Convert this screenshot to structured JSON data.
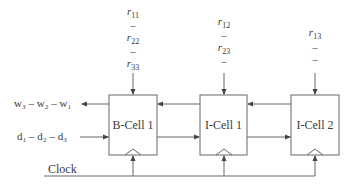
{
  "diagram": {
    "cells": [
      {
        "id": "bcell1",
        "label": "B-Cell 1"
      },
      {
        "id": "icell1",
        "label": "I-Cell 1"
      },
      {
        "id": "icell2",
        "label": "I-Cell 2"
      }
    ],
    "inputs": {
      "col1": [
        {
          "base": "r",
          "sub": "11"
        },
        {
          "dash": "–"
        },
        {
          "base": "r",
          "sub": "22"
        },
        {
          "dash": "–"
        },
        {
          "base": "r",
          "sub": "33"
        }
      ],
      "col2": [
        {
          "base": "r",
          "sub": "12"
        },
        {
          "dash": "–"
        },
        {
          "base": "r",
          "sub": "23"
        },
        {
          "dash": "–"
        }
      ],
      "col3": [
        {
          "base": "r",
          "sub": "13"
        },
        {
          "dash": "–"
        },
        {
          "dash": "–"
        }
      ]
    },
    "left_signals": {
      "output_w": "w₃ – w₂ – w₁",
      "input_d": "d₁ – d₂ – d₃"
    },
    "clock_label": "Clock",
    "colors": {
      "line": "#555555",
      "text": "#3a3a3a"
    }
  }
}
